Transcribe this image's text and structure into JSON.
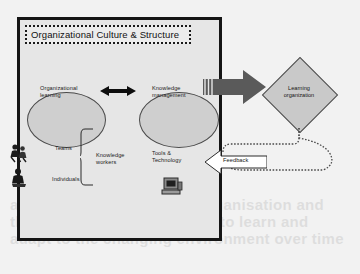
{
  "diagram": {
    "title": "Organizational Culture & Structure",
    "ghost_text": "and the way in which the organisation and the people within it are able to learn and adapt to the changing environment over time",
    "ellipses": [
      {
        "id": "organizational-learning",
        "label": "Organizational\nlearning"
      },
      {
        "id": "knowledge-management",
        "label": "Knowledge\nmanagement"
      }
    ],
    "labels": {
      "teams": "Teams",
      "individuals": "Individuals",
      "knowledge_workers": "Knowledge\nworkers",
      "tools_technology": "Tools &\nTechnology"
    },
    "outcome": {
      "label": "Learning\norganization"
    },
    "feedback": {
      "label": "Feedback"
    },
    "icons": {
      "people_group": "people-group-icon",
      "person_seated": "person-seated-icon",
      "computer": "computer-icon",
      "bidirectional_arrow": "bidirectional-arrow-icon",
      "block_arrow": "block-arrow-icon",
      "brace": "curly-brace-icon"
    },
    "colors": {
      "page_background": "#f2f2f2",
      "panel_background": "#e6e6e6",
      "panel_border": "#151515",
      "ellipse_fill": "#cfcfcf",
      "ellipse_stroke": "#4a4a4a",
      "diamond_fill": "#c9c9c9",
      "diamond_stroke": "#4d4d4d",
      "block_arrow_fill": "#5a5a5a",
      "text": "#141414"
    }
  }
}
